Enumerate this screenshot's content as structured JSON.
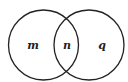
{
  "diagram": {
    "type": "venn",
    "stroke_color": "#222222",
    "background": "#ffffff",
    "sets": [
      {
        "name": "left",
        "cx": 43.5,
        "cy": 45,
        "r": 35
      },
      {
        "name": "right",
        "cx": 89,
        "cy": 45,
        "r": 35
      }
    ],
    "regions": {
      "left_only": "m",
      "intersection": "n",
      "right_only": "q"
    }
  }
}
